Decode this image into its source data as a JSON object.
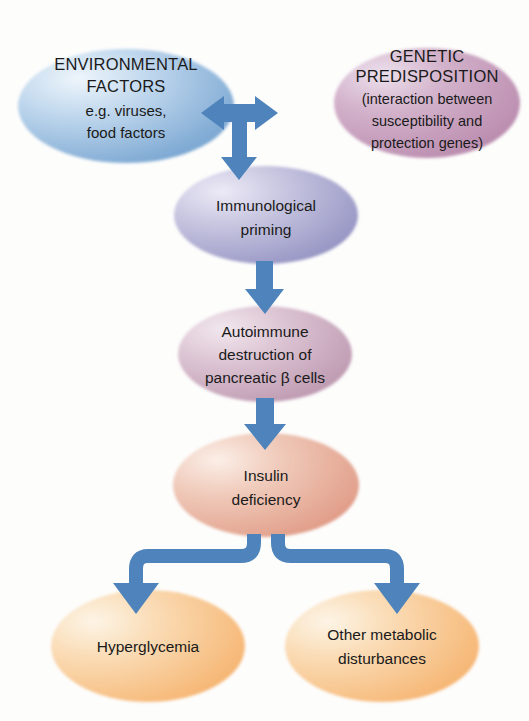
{
  "figure": {
    "background_color": "#fdfdfc",
    "arrow_color": "#4e84bb"
  },
  "nodes": {
    "environmental_factors": {
      "id": "environmental-factors",
      "lines": [
        "ENVIRONMENTAL",
        "FACTORS",
        "e.g. viruses,",
        "food factors"
      ],
      "line1": "ENVIRONMENTAL",
      "line2": "FACTORS",
      "line3": "e.g. viruses,",
      "line4": "food factors",
      "fill_light": "#e6f0f8",
      "fill_dark": "#7fa9d4",
      "cx": 126,
      "cy": 106,
      "rx": 108,
      "ry": 57
    },
    "genetic_predisposition": {
      "id": "genetic-predisposition",
      "lines": [
        "GENETIC",
        "PREDISPOSITION",
        "(interaction between",
        "susceptibility and",
        "protection genes)"
      ],
      "line1": "GENETIC",
      "line2": "PREDISPOSITION",
      "line3": "(interaction between",
      "line4": "susceptibility and",
      "line5": "protection genes)",
      "fill_light": "#e8dbe8",
      "fill_dark": "#bf93b3",
      "cx": 427,
      "cy": 103,
      "rx": 93,
      "ry": 55
    },
    "immunological_priming": {
      "id": "immunological-priming",
      "lines": [
        "Immunological",
        "priming"
      ],
      "line1": "Immunological",
      "line2": "priming",
      "fill_light": "#e4e2f0",
      "fill_dark": "#9b9cc8",
      "cx": 266,
      "cy": 215,
      "rx": 92,
      "ry": 49
    },
    "autoimmune_destruction": {
      "id": "autoimmune-destruction",
      "lines": [
        "Autoimmune",
        "destruction of",
        "pancreatic β cells"
      ],
      "line1": "Autoimmune",
      "line2": "destruction of",
      "line3": "pancreatic β cells",
      "fill_light": "#eadfe6",
      "fill_dark": "#c3a0b6",
      "cx": 265,
      "cy": 354,
      "rx": 87,
      "ry": 48
    },
    "insulin_deficiency": {
      "id": "insulin-deficiency",
      "lines": [
        "Insulin",
        "deficiency"
      ],
      "line1": "Insulin",
      "line2": "deficiency",
      "fill_light": "#f7e1d8",
      "fill_dark": "#e2a08c",
      "cx": 266,
      "cy": 485,
      "rx": 93,
      "ry": 52
    },
    "hyperglycemia": {
      "id": "hyperglycemia",
      "lines": [
        "Hyperglycemia"
      ],
      "line1": "Hyperglycemia",
      "fill_light": "#fbeedd",
      "fill_dark": "#f5b573",
      "cx": 148,
      "cy": 646,
      "rx": 97,
      "ry": 56
    },
    "other_metabolic_disturbances": {
      "id": "other-metabolic-disturbances",
      "lines": [
        "Other metabolic",
        "disturbances"
      ],
      "line1": "Other metabolic",
      "line2": "disturbances",
      "fill_light": "#fbeedd",
      "fill_dark": "#f5b573",
      "cx": 382,
      "cy": 646,
      "rx": 97,
      "ry": 56
    }
  },
  "connectors": [
    {
      "id": "bidirectional-top",
      "from": "environmental_factors",
      "to": "genetic_predisposition",
      "kind": "double-headed-horizontal"
    },
    {
      "id": "stem-to-priming",
      "from": "bidirectional-top",
      "to": "immunological_priming",
      "kind": "down"
    },
    {
      "id": "priming-to-autoimmune",
      "from": "immunological_priming",
      "to": "autoimmune_destruction",
      "kind": "down"
    },
    {
      "id": "autoimmune-to-insulin",
      "from": "autoimmune_destruction",
      "to": "insulin_deficiency",
      "kind": "down"
    },
    {
      "id": "insulin-to-hyperglycemia",
      "from": "insulin_deficiency",
      "to": "hyperglycemia",
      "kind": "elbow-left-down"
    },
    {
      "id": "insulin-to-other-metabolic",
      "from": "insulin_deficiency",
      "to": "other_metabolic_disturbances",
      "kind": "elbow-right-down"
    }
  ]
}
